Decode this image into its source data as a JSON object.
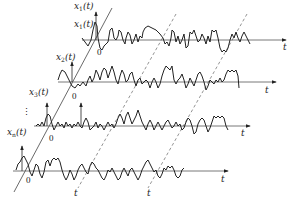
{
  "diagram": {
    "colors": {
      "stroke": "#222222",
      "axis": "#555555",
      "dashed": "#666666",
      "background": "#ffffff"
    },
    "rows": [
      {
        "label_main": "x",
        "label_sub": "1",
        "label_arg": "(t)",
        "label2_main": "x",
        "label2_sub": "1",
        "label2_arg": "(t)",
        "origin": "0",
        "axis_label": "t"
      },
      {
        "label_main": "x",
        "label_sub": "2",
        "label_arg": "(t)",
        "origin": "0",
        "axis_label": "t"
      },
      {
        "label_main": "x",
        "label_sub": "3",
        "label_arg": "(t)",
        "origin": "0",
        "axis_label": "t"
      },
      {
        "label_main": "x",
        "label_sub": "n",
        "label_arg": "(t)",
        "origin": "0",
        "axis_label": "t"
      }
    ],
    "ellipsis": "⋮",
    "time_markers": [
      {
        "label": "t"
      },
      {
        "label": "t"
      }
    ]
  }
}
